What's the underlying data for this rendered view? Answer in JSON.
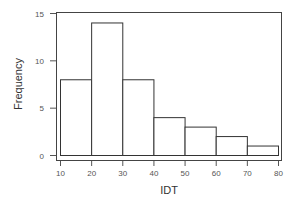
{
  "chart_data": {
    "type": "bar",
    "subtype": "histogram",
    "title": "",
    "xlabel": "IDT",
    "ylabel": "Frequency",
    "bins": [
      [
        10,
        20
      ],
      [
        20,
        30
      ],
      [
        30,
        40
      ],
      [
        40,
        50
      ],
      [
        50,
        60
      ],
      [
        60,
        70
      ],
      [
        70,
        80
      ]
    ],
    "categories": [
      "10-20",
      "20-30",
      "30-40",
      "40-50",
      "50-60",
      "60-70",
      "70-80"
    ],
    "values": [
      8,
      14,
      8,
      4,
      3,
      2,
      1
    ],
    "xlim": [
      10,
      80
    ],
    "ylim": [
      0,
      15
    ],
    "x_ticks": [
      10,
      20,
      30,
      40,
      50,
      60,
      70,
      80
    ],
    "y_ticks": [
      0,
      5,
      10,
      15
    ],
    "grid": false,
    "legend": null,
    "colors": {
      "bar_fill": "#ffffff",
      "bar_edge": "#333333",
      "frame": "#444444"
    }
  },
  "labels": {
    "xlabel": "IDT",
    "ylabel": "Frequency",
    "x_ticks": [
      "10",
      "20",
      "30",
      "40",
      "50",
      "60",
      "70",
      "80"
    ],
    "y_ticks": [
      "0",
      "5",
      "10",
      "15"
    ]
  }
}
